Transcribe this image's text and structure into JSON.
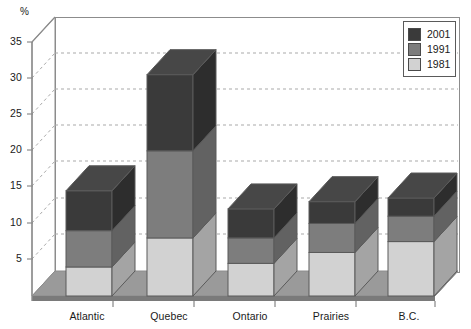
{
  "chart_data": {
    "type": "bar",
    "subtype": "stacked-column-3d",
    "title": "",
    "xlabel": "",
    "ylabel": "%",
    "ylim": [
      0,
      35
    ],
    "ytick_step": 5,
    "yticks": [
      5,
      10,
      15,
      20,
      25,
      30,
      35
    ],
    "ytick_labels": [
      "5",
      "10",
      "15",
      "20",
      "25",
      "30",
      "35"
    ],
    "grid": true,
    "grid_style": "dashed",
    "legend_position": "top-right",
    "categories": [
      "Atlantic",
      "Quebec",
      "Ontario",
      "Prairies",
      "B.C."
    ],
    "series": [
      {
        "name": "1981",
        "color": "#d2d2d2",
        "values": [
          4.0,
          8.0,
          4.5,
          6.0,
          7.5
        ]
      },
      {
        "name": "1991",
        "color": "#7d7d7d",
        "values": [
          5.0,
          12.0,
          3.5,
          4.0,
          3.5
        ]
      },
      {
        "name": "2001",
        "color": "#3a3a3a",
        "values": [
          5.5,
          10.5,
          4.0,
          3.0,
          2.5
        ]
      }
    ],
    "cumulative_tops": {
      "Atlantic": [
        4.0,
        9.0,
        14.5
      ],
      "Quebec": [
        8.0,
        20.0,
        30.5
      ],
      "Ontario": [
        4.5,
        8.0,
        12.0
      ],
      "Prairies": [
        6.0,
        10.0,
        13.0
      ],
      "B.C.": [
        7.5,
        11.0,
        13.5
      ]
    },
    "totals": [
      14.5,
      30.5,
      12.0,
      13.0,
      13.5
    ]
  },
  "legend": {
    "items": [
      {
        "label": "2001",
        "color": "#3a3a3a"
      },
      {
        "label": "1991",
        "color": "#7d7d7d"
      },
      {
        "label": "1981",
        "color": "#d2d2d2"
      }
    ]
  },
  "axis": {
    "unit_label": "%",
    "ytick_labels": [
      "35",
      "30",
      "25",
      "20",
      "15",
      "10",
      "5"
    ],
    "categories": [
      "Atlantic",
      "Quebec",
      "Ontario",
      "Prairies",
      "B.C."
    ]
  },
  "colors": {
    "series_2001": "#3a3a3a",
    "series_1991": "#7d7d7d",
    "series_1981": "#d2d2d2",
    "floor": "#9a9a9a",
    "floor_front": "#7a7a7a",
    "frame": "#8c8c8c",
    "gridline": "#a9a9a9",
    "text": "#1a1a1a"
  }
}
